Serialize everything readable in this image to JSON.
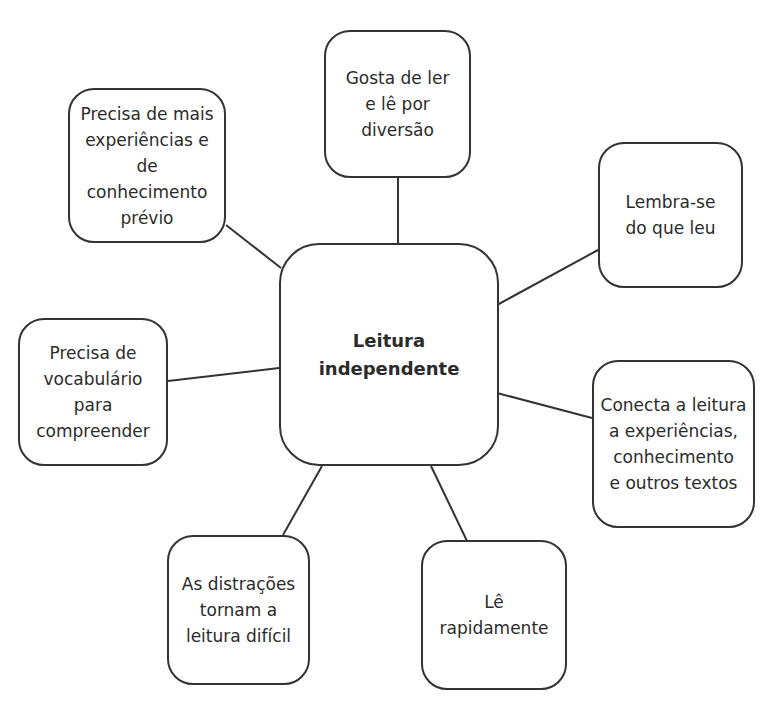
{
  "diagram": {
    "type": "mind-map",
    "center": {
      "label": "Leitura\nindependente"
    },
    "nodes": [
      {
        "id": "top",
        "label": "Gosta de ler\ne lê por\ndiversão"
      },
      {
        "id": "top_left",
        "label": "Precisa de mais\nexperiências e de\nconhecimento\nprévio"
      },
      {
        "id": "right_upper",
        "label": "Lembra-se\ndo que leu"
      },
      {
        "id": "right_lower",
        "label": "Conecta a leitura\na experiências,\nconhecimento\ne outros textos"
      },
      {
        "id": "left",
        "label": "Precisa de\nvocabulário\npara\ncompreender"
      },
      {
        "id": "bottom_left",
        "label": "As distrações\ntornam a\nleitura difícil"
      },
      {
        "id": "bottom_right",
        "label": "Lê\nrapidamente"
      }
    ],
    "colors": {
      "stroke": "#333333",
      "text": "#2b2b2b",
      "background": "#ffffff"
    }
  }
}
